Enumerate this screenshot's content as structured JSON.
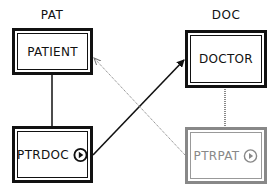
{
  "diagram": {
    "groups": [
      {
        "id": "pat",
        "label": "PAT"
      },
      {
        "id": "doc",
        "label": "DOC"
      }
    ],
    "nodes": [
      {
        "id": "patient",
        "label": "PATIENT",
        "style": "solid",
        "icon": null
      },
      {
        "id": "doctor",
        "label": "DOCTOR",
        "style": "solid",
        "icon": null
      },
      {
        "id": "ptrdoc",
        "label": "PTRDOC",
        "style": "solid",
        "icon": "play-circle-icon"
      },
      {
        "id": "ptrpat",
        "label": "PTRPAT",
        "style": "gray",
        "icon": "play-circle-icon"
      }
    ],
    "edges": [
      {
        "from": "patient",
        "to": "ptrdoc",
        "style": "solid",
        "arrow": false
      },
      {
        "from": "doctor",
        "to": "ptrpat",
        "style": "dotted-gray",
        "arrow": false
      },
      {
        "from": "ptrdoc",
        "to": "doctor",
        "style": "solid",
        "arrow": true
      },
      {
        "from": "ptrpat",
        "to": "patient",
        "style": "dotted-gray",
        "arrow": true
      }
    ],
    "colors": {
      "solid": "#111111",
      "gray": "#888888",
      "background": "#ffffff"
    }
  }
}
